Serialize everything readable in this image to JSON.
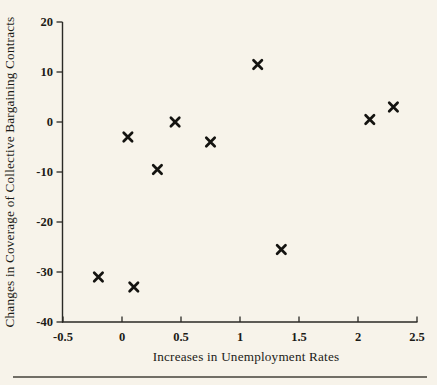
{
  "figure": {
    "background_color": "#f7f3ea",
    "ink_color": "#1c1b17",
    "axis_color": "#2a2925",
    "marker_color": "#141310",
    "bottom_rule_color": "#45423a"
  },
  "chart_data": {
    "type": "scatter",
    "title": "",
    "xlabel": "Increases in Unemployment Rates",
    "ylabel": "Changes in Coverage of Collective Bargaining Contracts",
    "xlim": [
      -0.5,
      2.5
    ],
    "ylim": [
      -40,
      20
    ],
    "x_ticks": [
      -0.5,
      0,
      0.5,
      1,
      1.5,
      2,
      2.5
    ],
    "x_tick_labels": [
      "-0.5",
      "0",
      "0.5",
      "1",
      "1.5",
      "2",
      "2.5"
    ],
    "y_ticks": [
      20,
      10,
      0,
      -10,
      -20,
      -30,
      -40
    ],
    "y_tick_labels": [
      "20",
      "10",
      "0",
      "-10",
      "-20",
      "-30",
      "-40"
    ],
    "grid": false,
    "legend": null,
    "marker": "x",
    "points": [
      {
        "x": -0.2,
        "y": -31
      },
      {
        "x": 0.05,
        "y": -3
      },
      {
        "x": 0.1,
        "y": -33
      },
      {
        "x": 0.3,
        "y": -9.5
      },
      {
        "x": 0.45,
        "y": 0
      },
      {
        "x": 0.75,
        "y": -4
      },
      {
        "x": 1.15,
        "y": 11.5
      },
      {
        "x": 1.35,
        "y": -25.5
      },
      {
        "x": 2.1,
        "y": 0.5
      },
      {
        "x": 2.3,
        "y": 3
      }
    ]
  }
}
